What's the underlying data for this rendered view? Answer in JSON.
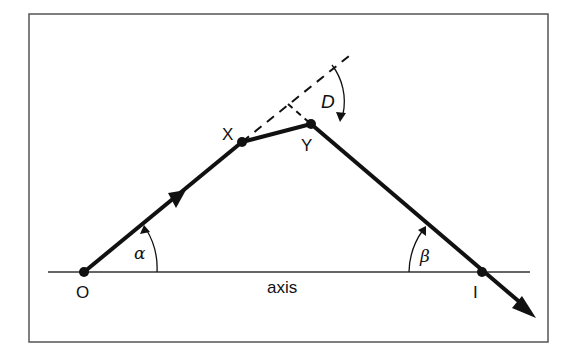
{
  "diagram": {
    "labels": {
      "object_point": "O",
      "image_point": "I",
      "point_x": "X",
      "point_y": "Y",
      "axis": "axis",
      "angle_alpha": "α",
      "angle_beta": "β",
      "deviation": "D"
    },
    "colors": {
      "line": "#111111",
      "frame": "#555555",
      "background": "#ffffff"
    }
  }
}
